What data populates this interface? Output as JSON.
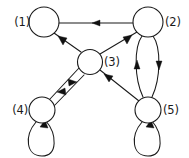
{
  "figure": {
    "type": "directed-graph-diagram",
    "title": "",
    "background_color": "#ffffff",
    "stroke_color": "#1a1a1a",
    "width": 189,
    "height": 158
  },
  "nodes": [
    {
      "id": "1",
      "label": "(1)",
      "cx": 44,
      "cy": 22,
      "r": 15,
      "label_side": "left",
      "label_x": 30,
      "label_y": 26
    },
    {
      "id": "2",
      "label": "(2)",
      "cx": 148,
      "cy": 22,
      "r": 15,
      "label_side": "right",
      "label_x": 165,
      "label_y": 26
    },
    {
      "id": "3",
      "label": "(3)",
      "cx": 90,
      "cy": 62,
      "r": 12.5,
      "label_side": "right",
      "label_x": 104,
      "label_y": 66
    },
    {
      "id": "4",
      "label": "(4)",
      "cx": 42,
      "cy": 110,
      "r": 13,
      "label_side": "left",
      "label_x": 28,
      "label_y": 114
    },
    {
      "id": "5",
      "label": "(5)",
      "cx": 148,
      "cy": 110,
      "r": 13,
      "label_side": "right",
      "label_x": 163,
      "label_y": 114
    }
  ],
  "edges": [
    {
      "from": "2",
      "to": "1",
      "style": "straight",
      "arrow_at": "mid"
    },
    {
      "from": "3",
      "to": "1",
      "style": "straight",
      "arrow_at": "mid"
    },
    {
      "from": "3",
      "to": "2",
      "style": "straight",
      "arrow_at": "mid"
    },
    {
      "from": "3",
      "to": "4",
      "style": "parallel-upper",
      "arrow_at": "mid"
    },
    {
      "from": "4",
      "to": "3",
      "style": "parallel-lower",
      "arrow_at": "mid"
    },
    {
      "from": "5",
      "to": "3",
      "style": "straight",
      "arrow_at": "mid"
    },
    {
      "from": "5",
      "to": "2",
      "style": "curved-left-arc",
      "arrow_at": "mid"
    },
    {
      "from": "2",
      "to": "5",
      "style": "curved-right-arc",
      "arrow_at": "mid"
    },
    {
      "from": "4",
      "to": "4",
      "style": "self-loop-below",
      "arrow_at": "node-entry"
    },
    {
      "from": "5",
      "to": "5",
      "style": "self-loop-below",
      "arrow_at": "node-entry"
    }
  ]
}
